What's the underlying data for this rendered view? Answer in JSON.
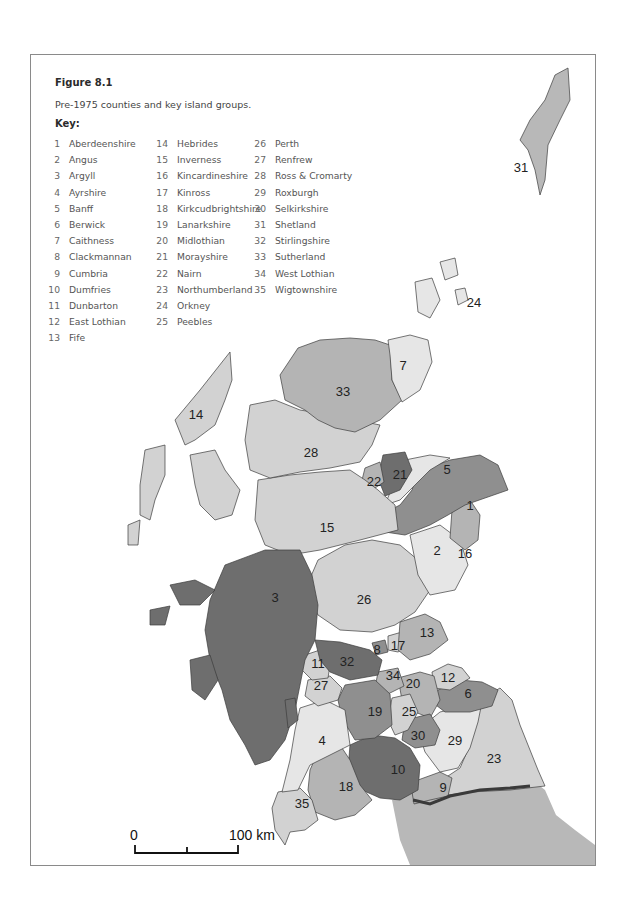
{
  "figure": {
    "title": "Figure 8.1",
    "caption": "Pre-1975 counties and key island groups.",
    "key_label": "Key:"
  },
  "key": {
    "col1": [
      {
        "num": "1",
        "name": "Aberdeenshire"
      },
      {
        "num": "2",
        "name": "Angus"
      },
      {
        "num": "3",
        "name": "Argyll"
      },
      {
        "num": "4",
        "name": "Ayrshire"
      },
      {
        "num": "5",
        "name": "Banff"
      },
      {
        "num": "6",
        "name": "Berwick"
      },
      {
        "num": "7",
        "name": "Caithness"
      },
      {
        "num": "8",
        "name": "Clackmannan"
      },
      {
        "num": "9",
        "name": "Cumbria"
      },
      {
        "num": "10",
        "name": "Dumfries"
      },
      {
        "num": "11",
        "name": "Dunbarton"
      },
      {
        "num": "12",
        "name": "East Lothian"
      },
      {
        "num": "13",
        "name": "Fife"
      }
    ],
    "col2": [
      {
        "num": "14",
        "name": "Hebrides"
      },
      {
        "num": "15",
        "name": "Inverness"
      },
      {
        "num": "16",
        "name": "Kincardineshire"
      },
      {
        "num": "17",
        "name": "Kinross"
      },
      {
        "num": "18",
        "name": "Kirkcudbrightshire"
      },
      {
        "num": "19",
        "name": "Lanarkshire"
      },
      {
        "num": "20",
        "name": "Midlothian"
      },
      {
        "num": "21",
        "name": "Morayshire"
      },
      {
        "num": "22",
        "name": "Nairn"
      },
      {
        "num": "23",
        "name": "Northumberland"
      },
      {
        "num": "24",
        "name": "Orkney"
      },
      {
        "num": "25",
        "name": "Peebles"
      }
    ],
    "col3": [
      {
        "num": "26",
        "name": "Perth"
      },
      {
        "num": "27",
        "name": "Renfrew"
      },
      {
        "num": "28",
        "name": "Ross & Cromarty"
      },
      {
        "num": "29",
        "name": "Roxburgh"
      },
      {
        "num": "30",
        "name": "Selkirkshire"
      },
      {
        "num": "31",
        "name": "Shetland"
      },
      {
        "num": "32",
        "name": "Stirlingshire"
      },
      {
        "num": "33",
        "name": "Sutherland"
      },
      {
        "num": "34",
        "name": "West Lothian"
      },
      {
        "num": "35",
        "name": "Wigtownshire"
      }
    ]
  },
  "map": {
    "region_labels": [
      "1",
      "2",
      "3",
      "4",
      "5",
      "6",
      "7",
      "8",
      "9",
      "10",
      "11",
      "12",
      "13",
      "14",
      "15",
      "16",
      "17",
      "18",
      "19",
      "20",
      "21",
      "22",
      "23",
      "24",
      "25",
      "26",
      "27",
      "28",
      "29",
      "30",
      "31",
      "32",
      "33",
      "34",
      "35"
    ],
    "colors": {
      "lightest": "#e6e6e6",
      "light": "#d2d2d2",
      "mid": "#b4b4b4",
      "midDark": "#8f8f8f",
      "dark": "#6e6e6e",
      "england": "#b8b8b8",
      "border": "#3c3c3c"
    }
  },
  "scale_bar": {
    "start_label": "0",
    "end_label": "100 km"
  }
}
